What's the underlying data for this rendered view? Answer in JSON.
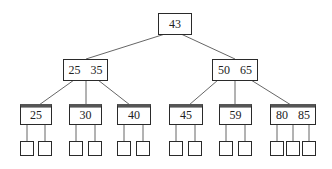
{
  "diagram": {
    "type": "2-3 tree / B-tree",
    "root": {
      "keys": [
        "43"
      ]
    },
    "internal": [
      {
        "keys": [
          "25",
          "35"
        ]
      },
      {
        "keys": [
          "50",
          "65"
        ]
      }
    ],
    "leaves": [
      {
        "keys": [
          "25"
        ],
        "children": 2
      },
      {
        "keys": [
          "30"
        ],
        "children": 2
      },
      {
        "keys": [
          "40"
        ],
        "children": 2
      },
      {
        "keys": [
          "45"
        ],
        "children": 2
      },
      {
        "keys": [
          "59"
        ],
        "children": 2
      },
      {
        "keys": [
          "80",
          "85"
        ],
        "children": 3
      }
    ]
  },
  "colors": {
    "line": "#555555",
    "border": "#2a2a2a",
    "text": "#222222"
  }
}
